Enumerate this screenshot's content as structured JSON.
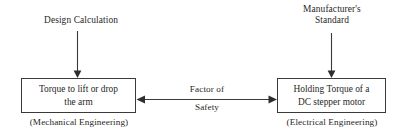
{
  "diagram": {
    "background_color": "#ffffff",
    "line_color": "#3a3a3a",
    "text_color": "#1f1f1f",
    "sources": [
      {
        "id": "design-calculation",
        "label": "Design Calculation",
        "target": "box-mechanical"
      },
      {
        "id": "manufacturers-standard",
        "label": "Manufacturer's\nStandard",
        "target": "box-electrical"
      }
    ],
    "boxes": [
      {
        "id": "box-mechanical",
        "label": "Torque to lift or drop\nthe arm",
        "caption": "(Mechanical Engineering)"
      },
      {
        "id": "box-electrical",
        "label": "Holding Torque of a\nDC stepper motor",
        "caption": "(Electrical Engineering)"
      }
    ],
    "relation": {
      "id": "factor-of-safety",
      "label_line1": "Factor of",
      "label_line2": "Safety",
      "arrow_type": "double-headed",
      "from": "box-mechanical",
      "to": "box-electrical"
    }
  }
}
